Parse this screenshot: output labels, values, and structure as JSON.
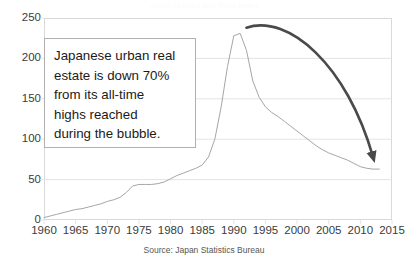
{
  "chart_data": {
    "type": "line",
    "title": "Japan Urban Land Price Index",
    "xlabel": "",
    "ylabel": "",
    "xlim": [
      1960,
      2015
    ],
    "ylim": [
      0,
      250
    ],
    "grid": true,
    "legend": null,
    "source": "Source:  Japan Statistics Bureau",
    "x_ticks": [
      1960,
      1965,
      1970,
      1975,
      1980,
      1985,
      1990,
      1995,
      2000,
      2005,
      2010,
      2015
    ],
    "y_ticks": [
      0,
      50,
      100,
      150,
      200,
      250
    ],
    "series": [
      {
        "name": "Japanese urban land price index",
        "color": "#a6a6a6",
        "x": [
          1960,
          1961,
          1962,
          1963,
          1964,
          1965,
          1966,
          1967,
          1968,
          1969,
          1970,
          1971,
          1972,
          1973,
          1974,
          1975,
          1976,
          1977,
          1978,
          1979,
          1980,
          1981,
          1982,
          1983,
          1984,
          1985,
          1986,
          1987,
          1988,
          1989,
          1990,
          1991,
          1992,
          1993,
          1994,
          1995,
          1996,
          1997,
          1998,
          1999,
          2000,
          2001,
          2002,
          2003,
          2004,
          2005,
          2006,
          2007,
          2008,
          2009,
          2010,
          2011,
          2012,
          2013
        ],
        "values": [
          3,
          5,
          7,
          9,
          11,
          13,
          14,
          16,
          18,
          20,
          23,
          25,
          28,
          34,
          42,
          44,
          44,
          44,
          45,
          47,
          51,
          55,
          58,
          61,
          64,
          68,
          78,
          100,
          140,
          190,
          228,
          231,
          210,
          172,
          152,
          140,
          133,
          128,
          122,
          116,
          110,
          104,
          98,
          92,
          87,
          83,
          80,
          77,
          74,
          70,
          66,
          64,
          63,
          63
        ]
      }
    ],
    "annotations": [
      {
        "name": "callout-text",
        "lines": [
          "Japanese urban real",
          "estate is down 70%",
          "from its all-time",
          "highs reached",
          "during the bubble."
        ],
        "box_border_color": "#b0b0b0"
      },
      {
        "name": "decline-arrow",
        "type": "curved-arrow",
        "color": "#4a4a4a",
        "from_year": 1992,
        "to_year": 2012,
        "from_value": 238,
        "to_value": 78
      }
    ]
  },
  "axis": {
    "y_labels": [
      "250",
      "200",
      "150",
      "100",
      "50",
      "0"
    ],
    "x_labels": [
      "1960",
      "1965",
      "1970",
      "1975",
      "1980",
      "1985",
      "1990",
      "1995",
      "2000",
      "2005",
      "2010",
      "2015"
    ]
  },
  "callout": {
    "line1": "Japanese urban real",
    "line2": "estate is down 70%",
    "line3": "from its all-time",
    "line4": "highs reached",
    "line5": "during the bubble."
  },
  "footer": {
    "source": "Source:  Japan Statistics Bureau"
  },
  "colors": {
    "line": "#a6a6a6",
    "arrow": "#4a4a4a",
    "grid": "#e4e4e4",
    "axis_text": "#3b3b3b",
    "plot_border": "#d9d9d9"
  }
}
